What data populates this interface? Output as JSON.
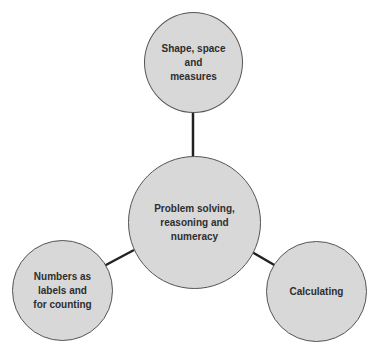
{
  "diagram": {
    "type": "hub-and-spoke",
    "center": {
      "label": "Problem solving,\nreasoning and\nnumeracy"
    },
    "nodes": [
      {
        "id": "top",
        "label": "Shape, space\nand\nmeasures"
      },
      {
        "id": "bottom-left",
        "label": "Numbers as\nlabels and\nfor counting"
      },
      {
        "id": "bottom-right",
        "label": "Calculating"
      }
    ],
    "edges": [
      {
        "from": "center",
        "to": "top"
      },
      {
        "from": "center",
        "to": "bottom-left"
      },
      {
        "from": "center",
        "to": "bottom-right"
      }
    ],
    "colors": {
      "fill": "#d8d8d8",
      "border": "#555555",
      "connector": "#222222",
      "text": "#2e2e2e"
    }
  }
}
